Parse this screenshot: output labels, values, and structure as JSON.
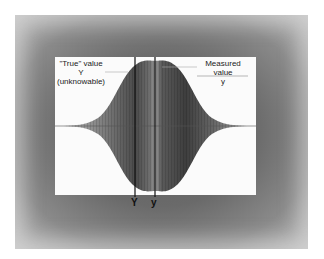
{
  "diagram": {
    "true_value_label": {
      "line1": "\"True\" value",
      "line2": "Y",
      "line3": "(unknowable)"
    },
    "measured_value_label": {
      "line1": "Measured value",
      "line2": "y"
    },
    "axis_markers": {
      "true": "Y",
      "measured": "y"
    },
    "colors": {
      "frame": "#6a6a6a",
      "plot_bg": "#fbfbfb",
      "bell_fill": "#555555",
      "marker_line": "#111111"
    }
  }
}
